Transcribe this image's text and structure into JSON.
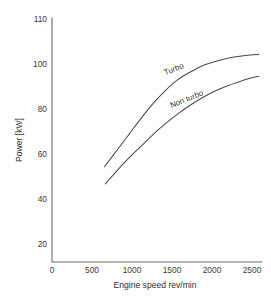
{
  "chart_data": {
    "type": "line",
    "title": "",
    "xlabel": "Engine speed rev/min",
    "ylabel": "Power [kW]",
    "xlim": [
      0,
      2600
    ],
    "ylim": [
      0,
      114
    ],
    "grid": false,
    "legend_position": "inline-curve-labels",
    "xticks": [
      0,
      500,
      1000,
      1500,
      2000,
      2500
    ],
    "xtick_labels": [
      "0",
      "500",
      "1000",
      "1500",
      "2000",
      "2500"
    ],
    "yticks": [
      20,
      40,
      60,
      80,
      100,
      110
    ],
    "ytick_labels": [
      "20",
      "40",
      "60",
      "80",
      "100",
      "110"
    ],
    "series": [
      {
        "name": "Turbo",
        "x": [
          650,
          800,
          950,
          1100,
          1250,
          1400,
          1550,
          1700,
          1850,
          2000,
          2150,
          2300,
          2450,
          2560
        ],
        "values": [
          44.5,
          52.0,
          59.5,
          67.0,
          74.0,
          80.0,
          85.0,
          88.5,
          91.5,
          93.5,
          95.0,
          96.0,
          96.7,
          97.0
        ]
      },
      {
        "name": "Non turbo",
        "x": [
          660,
          800,
          950,
          1100,
          1250,
          1400,
          1550,
          1700,
          1850,
          2000,
          2150,
          2300,
          2450,
          2560
        ],
        "values": [
          36.5,
          42.5,
          48.5,
          54.0,
          59.5,
          64.5,
          69.0,
          73.0,
          76.5,
          79.5,
          82.0,
          84.0,
          85.8,
          86.8
        ]
      }
    ],
    "annotations": [
      {
        "text": "Turbo",
        "x": 1520,
        "y": 89.0,
        "rotation": -22
      },
      {
        "text": "Non turbo",
        "x": 1680,
        "y": 75.0,
        "rotation": -22
      }
    ],
    "colors": {
      "curve": "#4a4a4a",
      "axis": "#6b6b6b",
      "text": "#3a3a3a",
      "background": "#ffffff"
    }
  }
}
